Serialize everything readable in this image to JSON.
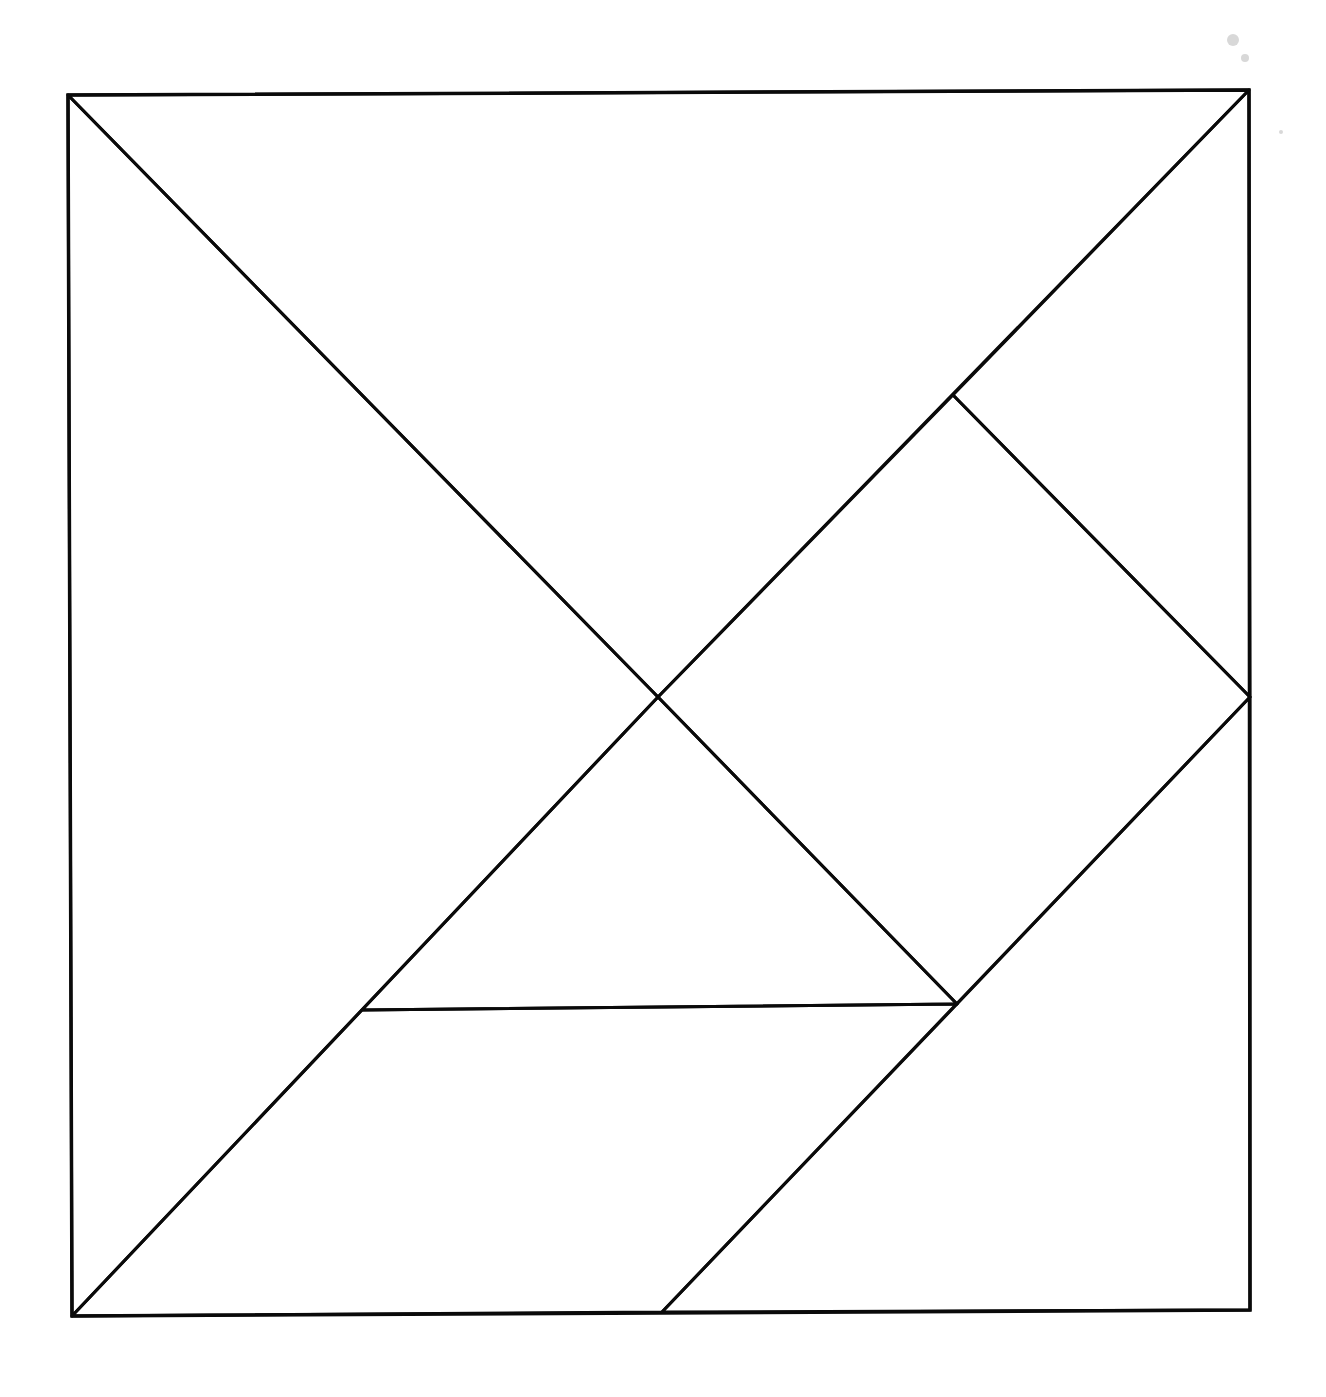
{
  "diagram": {
    "type": "tangram",
    "title": "",
    "stroke_color": "#0a0a0a",
    "background": "#ffffff",
    "outer_square": [
      [
        68,
        95
      ],
      [
        1249,
        90
      ],
      [
        1250,
        1310
      ],
      [
        72,
        1316
      ]
    ],
    "pieces": [
      {
        "id": "large-triangle-top",
        "shape": "triangle",
        "points": [
          [
            68,
            95
          ],
          [
            1249,
            90
          ],
          [
            658,
            697
          ]
        ]
      },
      {
        "id": "large-triangle-left",
        "shape": "triangle",
        "points": [
          [
            68,
            95
          ],
          [
            658,
            697
          ],
          [
            72,
            1316
          ]
        ]
      },
      {
        "id": "small-triangle-top-right",
        "shape": "triangle",
        "points": [
          [
            1249,
            90
          ],
          [
            1250,
            697
          ],
          [
            953,
            395
          ]
        ]
      },
      {
        "id": "square",
        "shape": "square",
        "points": [
          [
            953,
            395
          ],
          [
            1250,
            697
          ],
          [
            957,
            1004
          ],
          [
            658,
            697
          ]
        ]
      },
      {
        "id": "small-triangle-middle",
        "shape": "triangle",
        "points": [
          [
            658,
            697
          ],
          [
            957,
            1004
          ],
          [
            362,
            1010
          ]
        ]
      },
      {
        "id": "parallelogram",
        "shape": "parallelogram",
        "points": [
          [
            362,
            1010
          ],
          [
            957,
            1004
          ],
          [
            662,
            1312
          ],
          [
            72,
            1316
          ]
        ]
      },
      {
        "id": "medium-triangle-bottom-right",
        "shape": "triangle",
        "points": [
          [
            1250,
            697
          ],
          [
            1250,
            1310
          ],
          [
            662,
            1312
          ]
        ]
      }
    ]
  }
}
